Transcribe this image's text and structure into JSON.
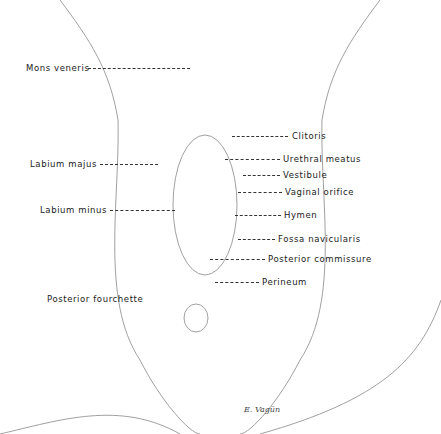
{
  "figure": {
    "type": "anatomical line illustration",
    "note": "Anatomical drawing rendered as neutral outline; only labels and leader lines reproduced"
  },
  "labels_left": [
    {
      "text": "Mons veneris",
      "x": 26,
      "y": 63,
      "line_to_x": 190,
      "line_y": 68
    },
    {
      "text": "Labium majus",
      "x": 30,
      "y": 159,
      "line_to_x": 158,
      "line_y": 164
    },
    {
      "text": "Labium minus",
      "x": 40,
      "y": 205,
      "line_to_x": 175,
      "line_y": 210
    },
    {
      "text": "Posterior fourchette",
      "x": 47,
      "y": 294,
      "line_to_x": null,
      "line_y": null
    }
  ],
  "labels_right": [
    {
      "text": "Clitoris",
      "x": 292,
      "y": 131,
      "line_from_x": 232,
      "line_y": 136
    },
    {
      "text": "Urethral meatus",
      "x": 283,
      "y": 154,
      "line_from_x": 225,
      "line_y": 159
    },
    {
      "text": "Vestibule",
      "x": 283,
      "y": 170,
      "line_from_x": 243,
      "line_y": 175
    },
    {
      "text": "Vaginal orifice",
      "x": 285,
      "y": 187,
      "line_from_x": 238,
      "line_y": 192
    },
    {
      "text": "Hymen",
      "x": 284,
      "y": 210,
      "line_from_x": 235,
      "line_y": 215
    },
    {
      "text": "Fossa navicularis",
      "x": 278,
      "y": 234,
      "line_from_x": 238,
      "line_y": 239
    },
    {
      "text": "Posterior commissure",
      "x": 268,
      "y": 254,
      "line_from_x": 210,
      "line_y": 259
    },
    {
      "text": "Perineum",
      "x": 262,
      "y": 277,
      "line_from_x": 215,
      "line_y": 282
    }
  ],
  "signature": {
    "text": "E. Vagün",
    "x": 244,
    "y": 405
  }
}
